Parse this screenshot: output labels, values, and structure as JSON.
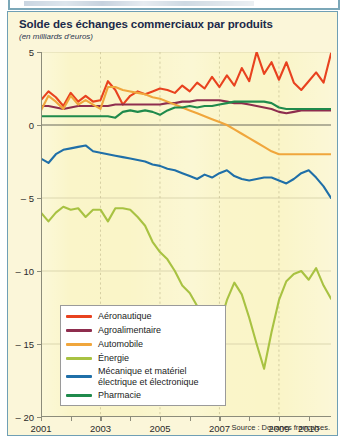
{
  "top_cutoff": {
    "description": "partially-cropped headline from preceding page element",
    "legible": false
  },
  "figure": {
    "title": "Solde des échanges commerciaux par produits",
    "subtitle": "(en milliards d'euros)",
    "source": "Source : Douanes françaises.",
    "border_color": "#6f9fb5",
    "card_background": "#fbf6d9",
    "plot_background": "#faf5c8"
  },
  "chart_data": {
    "type": "line",
    "title": "Solde des échanges commerciaux par produits",
    "subtitle": "(en milliards d'euros)",
    "xlabel": "",
    "ylabel": "",
    "unit": "milliards d'euros",
    "xlim": [
      2001,
      2010.75
    ],
    "ylim": [
      -20,
      5
    ],
    "yticks": [
      5,
      0,
      -5,
      -10,
      -15,
      -20
    ],
    "ytick_labels": [
      "5",
      "0",
      "– 5",
      "– 10",
      "– 15",
      "– 20"
    ],
    "xticks": [
      2001,
      2002,
      2003,
      2004,
      2005,
      2006,
      2007,
      2008,
      2009,
      2010
    ],
    "xtick_labels": [
      "2001",
      "",
      "2003",
      "",
      "2005",
      "",
      "2007",
      "",
      "2009",
      "2010"
    ],
    "xtick_labels_shown": [
      "2001",
      "2003",
      "2005",
      "2007",
      "2009",
      "2010"
    ],
    "grid": {
      "horizontal": true,
      "horizontal_style": "solid-faint",
      "vertical": true,
      "vertical_style": "dashed",
      "vertical_at": [
        2003,
        2005,
        2007,
        2009
      ]
    },
    "zero_line": true,
    "legend_position": "lower-left-inside",
    "frequency": "quarterly",
    "x": [
      2001.0,
      2001.25,
      2001.5,
      2001.75,
      2002.0,
      2002.25,
      2002.5,
      2002.75,
      2003.0,
      2003.25,
      2003.5,
      2003.75,
      2004.0,
      2004.25,
      2004.5,
      2004.75,
      2005.0,
      2005.25,
      2005.5,
      2005.75,
      2006.0,
      2006.25,
      2006.5,
      2006.75,
      2007.0,
      2007.25,
      2007.5,
      2007.75,
      2008.0,
      2008.25,
      2008.5,
      2008.75,
      2009.0,
      2009.25,
      2009.5,
      2009.75,
      2010.0,
      2010.25,
      2010.5,
      2010.75
    ],
    "series": [
      {
        "name": "Aéronautique",
        "color": "#e8421f",
        "values": [
          1.7,
          2.3,
          1.9,
          1.3,
          2.2,
          1.6,
          2.0,
          1.6,
          1.7,
          3.0,
          2.4,
          1.4,
          2.0,
          2.3,
          2.1,
          2.3,
          2.5,
          2.4,
          2.2,
          2.7,
          2.3,
          2.9,
          2.5,
          3.3,
          2.6,
          3.4,
          2.7,
          3.9,
          3.0,
          5.0,
          3.5,
          4.3,
          3.1,
          4.3,
          2.9,
          2.4,
          3.0,
          3.6,
          2.9,
          4.9
        ]
      },
      {
        "name": "Agroalimentaire",
        "color": "#8e2d4e",
        "values": [
          1.3,
          1.3,
          1.2,
          1.1,
          1.2,
          1.3,
          1.3,
          1.3,
          1.3,
          1.3,
          1.4,
          1.4,
          1.4,
          1.4,
          1.4,
          1.4,
          1.4,
          1.5,
          1.5,
          1.6,
          1.6,
          1.7,
          1.7,
          1.7,
          1.7,
          1.6,
          1.5,
          1.5,
          1.4,
          1.3,
          1.2,
          1.1,
          0.9,
          0.8,
          0.9,
          1.0,
          1.0,
          1.0,
          1.0,
          1.0
        ]
      },
      {
        "name": "Automobile",
        "color": "#f0a63c",
        "values": [
          1.0,
          2.0,
          1.6,
          1.1,
          2.0,
          1.4,
          1.7,
          1.4,
          1.1,
          2.6,
          2.6,
          2.4,
          2.3,
          2.2,
          2.1,
          1.9,
          1.8,
          1.6,
          1.4,
          1.2,
          1.0,
          0.8,
          0.6,
          0.4,
          0.2,
          0.0,
          -0.3,
          -0.6,
          -0.9,
          -1.2,
          -1.5,
          -1.8,
          -2.0,
          -2.0,
          -2.0,
          -2.0,
          -2.0,
          -2.0,
          -2.0,
          -2.0
        ]
      },
      {
        "name": "Énergie",
        "color": "#a8c242",
        "values": [
          -6.0,
          -6.6,
          -6.0,
          -5.6,
          -5.8,
          -5.7,
          -6.3,
          -5.8,
          -5.8,
          -6.6,
          -5.7,
          -5.7,
          -5.8,
          -6.3,
          -6.9,
          -8.0,
          -8.7,
          -9.2,
          -10.0,
          -11.0,
          -11.5,
          -12.4,
          -14.3,
          -16.0,
          -13.7,
          -12.0,
          -10.8,
          -11.6,
          -13.2,
          -15.0,
          -16.7,
          -14.2,
          -12.0,
          -10.7,
          -10.2,
          -10.0,
          -10.6,
          -9.8,
          -11.0,
          -11.9
        ]
      },
      {
        "name": "Mécanique et matériel\nélectrique et électronique",
        "color": "#1f6fa8",
        "values": [
          -2.3,
          -2.6,
          -2.0,
          -1.7,
          -1.6,
          -1.5,
          -1.4,
          -1.8,
          -1.9,
          -2.0,
          -2.1,
          -2.2,
          -2.3,
          -2.4,
          -2.5,
          -2.7,
          -2.8,
          -3.0,
          -3.1,
          -3.3,
          -3.5,
          -3.7,
          -3.4,
          -3.6,
          -3.3,
          -3.1,
          -3.5,
          -3.7,
          -3.8,
          -3.7,
          -3.6,
          -3.6,
          -3.8,
          -4.0,
          -3.7,
          -3.3,
          -3.1,
          -3.6,
          -4.2,
          -5.0
        ]
      },
      {
        "name": "Pharmacie",
        "color": "#1f8a4c",
        "values": [
          0.6,
          0.6,
          0.6,
          0.6,
          0.6,
          0.6,
          0.6,
          0.6,
          0.6,
          0.6,
          0.5,
          0.9,
          1.0,
          0.9,
          1.0,
          0.9,
          0.7,
          1.0,
          1.2,
          1.2,
          1.3,
          1.2,
          1.3,
          1.3,
          1.4,
          1.5,
          1.6,
          1.6,
          1.6,
          1.6,
          1.6,
          1.5,
          1.2,
          1.1,
          1.1,
          1.1,
          1.1,
          1.1,
          1.1,
          1.1
        ]
      }
    ]
  },
  "legend": {
    "items": [
      {
        "label": "Aéronautique",
        "color": "#e8421f"
      },
      {
        "label": "Agroalimentaire",
        "color": "#8e2d4e"
      },
      {
        "label": "Automobile",
        "color": "#f0a63c"
      },
      {
        "label": "Énergie",
        "color": "#a8c242"
      },
      {
        "label": "Mécanique et matériel\nélectrique et électronique",
        "color": "#1f6fa8"
      },
      {
        "label": "Pharmacie",
        "color": "#1f8a4c"
      }
    ]
  }
}
